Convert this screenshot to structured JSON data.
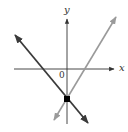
{
  "graph": {
    "x_axis_label": "x",
    "y_axis_label": "y",
    "origin_label": "0",
    "colors": {
      "axes": "#333333",
      "line_dark": "#3a3a3a",
      "line_light": "#9a9a9a",
      "point": "#000000",
      "background": "#ffffff"
    },
    "lines": [
      {
        "name": "decreasing-line",
        "shade": "dark",
        "from": [
          15,
          35
        ],
        "to": [
          88,
          123
        ]
      },
      {
        "name": "increasing-line",
        "shade": "light",
        "from": [
          116,
          17
        ],
        "to": [
          54,
          120
        ]
      }
    ],
    "intersection_point": {
      "description": "common y-intercept below origin",
      "px": [
        67,
        99
      ]
    }
  }
}
